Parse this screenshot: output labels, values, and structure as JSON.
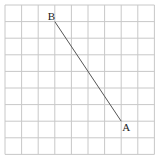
{
  "diagram": {
    "grid": {
      "cols": 9,
      "rows": 9,
      "origin_x": 5,
      "origin_y": 5,
      "cell": 16.6,
      "line_color": "#c8c8c8"
    },
    "segment": {
      "from": "B",
      "to": "A",
      "color": "#555555"
    },
    "points": [
      {
        "label": "B",
        "gx": 3,
        "gy": 1,
        "label_dx": -4,
        "label_dy": -2
      },
      {
        "label": "A",
        "gx": 7,
        "gy": 7,
        "label_dx": 4,
        "label_dy": 10
      }
    ]
  }
}
